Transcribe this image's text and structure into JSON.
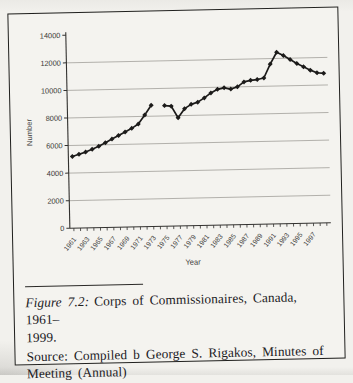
{
  "figure": {
    "caption_label": "Figure 7.2:",
    "caption_line1": "Corps of Commissionaires, Canada, 1961–",
    "caption_line2": "1999.",
    "source_line1": "Source: Compiled b George S. Rigakos, Minutes of",
    "source_line2": "Meeting (Annual)"
  },
  "chart_data": {
    "type": "line",
    "title": "",
    "xlabel": "Year",
    "ylabel": "Number",
    "ylim": [
      0,
      14000
    ],
    "ytick_step": 2000,
    "ytick_labels": [
      "0",
      "2000",
      "4000",
      "6000",
      "8000",
      "10000",
      "12000",
      "14000"
    ],
    "grid": true,
    "legend": "none",
    "marker": "diamond",
    "line_color": "#1c1b1a",
    "grid_color": "#a29f9a",
    "note": "single series; 1974 value missing creating a line break",
    "x": [
      1961,
      1962,
      1963,
      1964,
      1965,
      1966,
      1967,
      1968,
      1969,
      1970,
      1971,
      1972,
      1973,
      1974,
      1975,
      1976,
      1977,
      1978,
      1979,
      1980,
      1981,
      1982,
      1983,
      1984,
      1985,
      1986,
      1987,
      1988,
      1989,
      1990,
      1991,
      1992,
      1993,
      1994,
      1995,
      1996,
      1997,
      1998,
      1999
    ],
    "xtick_labels": [
      "1961",
      "1963",
      "1965",
      "1967",
      "1969",
      "1971",
      "1973",
      "1975",
      "1977",
      "1979",
      "1981",
      "1983",
      "1985",
      "1987",
      "1989",
      "1991",
      "1993",
      "1995",
      "1997"
    ],
    "values": [
      5200,
      5350,
      5500,
      5700,
      5900,
      6150,
      6400,
      6650,
      6900,
      7150,
      7450,
      8100,
      8800,
      null,
      8750,
      8700,
      7850,
      8500,
      8800,
      8950,
      9250,
      9600,
      9850,
      9950,
      9850,
      10000,
      10350,
      10450,
      10500,
      10600,
      11600,
      12450,
      12200,
      11900,
      11600,
      11350,
      11100,
      10900,
      10850
    ]
  }
}
